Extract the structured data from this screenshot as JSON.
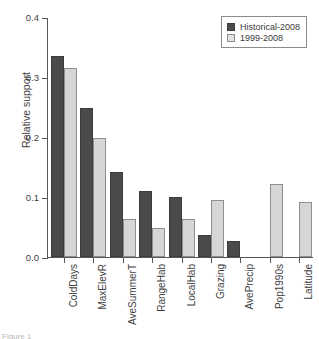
{
  "chart_data": {
    "type": "bar",
    "title": "",
    "xlabel": "",
    "ylabel": "Relative support",
    "ylim": [
      0.0,
      0.4
    ],
    "ytick_labels": [
      "0.0",
      "0.1",
      "0.2",
      "0.3",
      "0.4"
    ],
    "ytick_values": [
      0.0,
      0.1,
      0.2,
      0.3,
      0.4
    ],
    "grid": false,
    "legend_position": "top-right",
    "categories": [
      "ColdDays",
      "MaxElevR",
      "AveSummerT",
      "RangeHab",
      "LocalHab",
      "Grazing",
      "AvePrecip",
      "Pop1990s",
      "Latitude"
    ],
    "series": [
      {
        "name": "Historical-2008",
        "color": "#4a4a4a",
        "values": [
          0.335,
          0.249,
          0.142,
          0.11,
          0.1,
          0.037,
          0.027,
          0.0,
          0.0
        ]
      },
      {
        "name": "1999-2008",
        "color": "#d6d6d6",
        "values": [
          0.315,
          0.198,
          0.063,
          0.049,
          0.064,
          0.095,
          0.0,
          0.122,
          0.092
        ]
      }
    ]
  },
  "legend": {
    "entries": [
      {
        "label": "Historical-2008"
      },
      {
        "label": "1999-2008"
      }
    ]
  },
  "caption": {
    "text": "Figure 1"
  }
}
